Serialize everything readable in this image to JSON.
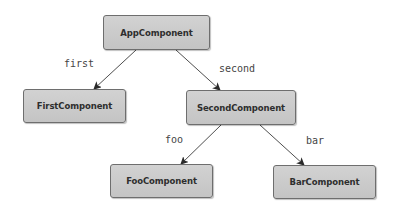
{
  "diagram": {
    "type": "component-tree",
    "nodes": [
      {
        "id": "app",
        "label": "AppComponent",
        "x": 103,
        "y": 15,
        "w": 107,
        "h": 35
      },
      {
        "id": "first",
        "label": "FirstComponent",
        "x": 23,
        "y": 89,
        "w": 103,
        "h": 34
      },
      {
        "id": "second",
        "label": "SecondComponent",
        "x": 186,
        "y": 90,
        "w": 110,
        "h": 35
      },
      {
        "id": "foo",
        "label": "FooComponent",
        "x": 110,
        "y": 164,
        "w": 103,
        "h": 34
      },
      {
        "id": "bar",
        "label": "BarComponent",
        "x": 273,
        "y": 165,
        "w": 103,
        "h": 34
      }
    ],
    "edges": [
      {
        "from": "app",
        "to": "first",
        "label": "first",
        "x1": 136,
        "y1": 50,
        "x2": 94,
        "y2": 89,
        "lx": 64,
        "ly": 59
      },
      {
        "from": "app",
        "to": "second",
        "label": "second",
        "x1": 176,
        "y1": 50,
        "x2": 220,
        "y2": 90,
        "lx": 219,
        "ly": 64
      },
      {
        "from": "second",
        "to": "foo",
        "label": "foo",
        "x1": 221,
        "y1": 125,
        "x2": 181,
        "y2": 164,
        "lx": 165,
        "ly": 135
      },
      {
        "from": "second",
        "to": "bar",
        "label": "bar",
        "x1": 260,
        "y1": 125,
        "x2": 304,
        "y2": 165,
        "lx": 306,
        "ly": 136
      }
    ],
    "colors": {
      "node_fill": "#cbcbcb",
      "node_border": "#6e6e6e",
      "node_text": "#2e2e2e",
      "edge": "#3a3a3a",
      "label_text": "#444444"
    }
  }
}
